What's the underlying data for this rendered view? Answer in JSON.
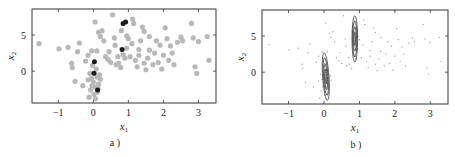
{
  "chart_data": [
    {
      "type": "scatter",
      "panel": "a",
      "caption": "a )",
      "xlabel": "x1",
      "ylabel": "x2",
      "xlim": [
        -1.75,
        3.5
      ],
      "ylim": [
        -4.4,
        8.6
      ],
      "xticks": [
        -1,
        0,
        1,
        2,
        3
      ],
      "yticks": [
        0,
        5
      ],
      "grid": false,
      "series": [
        {
          "name": "data points",
          "color": "#b8b8b8",
          "points": [
            [
              -1.55,
              3.8
            ],
            [
              -0.98,
              3.1
            ],
            [
              -0.72,
              3.3
            ],
            [
              -0.62,
              1.1
            ],
            [
              -0.6,
              0.5
            ],
            [
              -0.45,
              2.7
            ],
            [
              -0.4,
              3.9
            ],
            [
              -0.52,
              -1.4
            ],
            [
              -0.3,
              -2.0
            ],
            [
              -0.22,
              1.4
            ],
            [
              -0.15,
              2.2
            ],
            [
              -0.05,
              2.8
            ],
            [
              0.05,
              6.8
            ],
            [
              0.15,
              5.4
            ],
            [
              0.2,
              4.8
            ],
            [
              0.25,
              5.6
            ],
            [
              0.3,
              4.2
            ],
            [
              0.1,
              2.8
            ],
            [
              0.35,
              2.0
            ],
            [
              0.42,
              1.6
            ],
            [
              0.5,
              1.2
            ],
            [
              0.55,
              7.8
            ],
            [
              0.6,
              4.6
            ],
            [
              0.62,
              3.6
            ],
            [
              0.7,
              2.0
            ],
            [
              0.72,
              1.1
            ],
            [
              0.78,
              0.5
            ],
            [
              0.85,
              2.3
            ],
            [
              0.9,
              1.8
            ],
            [
              0.95,
              3.2
            ],
            [
              1.0,
              4.5
            ],
            [
              1.05,
              2.0
            ],
            [
              1.1,
              3.8
            ],
            [
              1.12,
              7.2
            ],
            [
              1.15,
              6.6
            ],
            [
              1.2,
              1.5
            ],
            [
              1.25,
              0.6
            ],
            [
              1.3,
              3.0
            ],
            [
              1.35,
              4.2
            ],
            [
              1.4,
              6.1
            ],
            [
              1.45,
              5.5
            ],
            [
              1.5,
              0.2
            ],
            [
              1.55,
              1.8
            ],
            [
              1.6,
              4.8
            ],
            [
              1.7,
              0.9
            ],
            [
              1.75,
              2.5
            ],
            [
              1.8,
              4.2
            ],
            [
              1.85,
              1.2
            ],
            [
              1.9,
              3.6
            ],
            [
              1.95,
              0.3
            ],
            [
              2.0,
              2.2
            ],
            [
              2.05,
              6.0
            ],
            [
              2.1,
              4.5
            ],
            [
              2.2,
              3.5
            ],
            [
              2.25,
              2.5
            ],
            [
              2.3,
              0.9
            ],
            [
              2.4,
              4.0
            ],
            [
              2.5,
              4.7
            ],
            [
              2.55,
              4.2
            ],
            [
              2.8,
              6.6
            ],
            [
              2.85,
              4.6
            ],
            [
              2.9,
              0.6
            ],
            [
              2.95,
              -0.3
            ],
            [
              3.0,
              4.1
            ],
            [
              3.25,
              4.8
            ],
            [
              3.3,
              1.5
            ],
            [
              1.3,
              2.2
            ],
            [
              1.45,
              1.1
            ],
            [
              0.95,
              4.9
            ],
            [
              0.8,
              5.6
            ],
            [
              1.6,
              2.9
            ],
            [
              2.15,
              1.5
            ],
            [
              0.65,
              0.9
            ],
            [
              0.45,
              2.7
            ],
            [
              -0.1,
              -0.3
            ],
            [
              -0.05,
              -1.0
            ],
            [
              0.0,
              -1.5
            ],
            [
              0.05,
              -2.2
            ],
            [
              0.1,
              -0.8
            ],
            [
              0.15,
              -1.8
            ],
            [
              -0.08,
              -2.6
            ],
            [
              0.02,
              -3.2
            ],
            [
              0.12,
              -2.9
            ],
            [
              -0.12,
              -3.6
            ],
            [
              0.08,
              0.3
            ],
            [
              -0.02,
              0.8
            ],
            [
              0.18,
              -0.5
            ],
            [
              -0.15,
              -1.2
            ],
            [
              0.2,
              -1.1
            ],
            [
              0.06,
              -3.8
            ],
            [
              -0.04,
              -2.0
            ],
            [
              0.14,
              -2.4
            ]
          ]
        },
        {
          "name": "highlighted points",
          "color": "#1a1a1a",
          "points": [
            [
              0.85,
              6.6
            ],
            [
              0.92,
              6.8
            ],
            [
              0.82,
              3.0
            ],
            [
              0.03,
              1.3
            ],
            [
              0.02,
              -0.3
            ],
            [
              0.12,
              -2.6
            ]
          ]
        }
      ]
    },
    {
      "type": "scatter",
      "panel": "b",
      "caption": "b )",
      "xlabel": "x1",
      "ylabel": "x2",
      "xlim": [
        -1.75,
        3.5
      ],
      "ylim": [
        -4.4,
        8.6
      ],
      "xticks": [
        -1,
        0,
        1,
        2,
        3
      ],
      "yticks": [
        0,
        5
      ],
      "grid": false,
      "series": [
        {
          "name": "data points (small markers)",
          "color": "#a0a0a0",
          "marker": "small"
        },
        {
          "name": "density contours",
          "color": "#222222",
          "contours": [
            {
              "center": [
                0.87,
                4.6
              ],
              "rx": [
                0.08,
                0.06,
                0.04,
                0.02
              ],
              "ry": [
                3.2,
                2.5,
                1.7,
                0.9
              ]
            },
            {
              "center": [
                0.05,
                -0.6
              ],
              "rx": [
                0.09,
                0.065,
                0.04,
                0.02
              ],
              "ry": [
                3.3,
                2.6,
                1.8,
                1.0
              ],
              "tilt_deg": -4
            }
          ]
        }
      ]
    }
  ],
  "panels": [
    {
      "caption": "a )",
      "xlabel_main": "x",
      "xlabel_sub": "1",
      "ylabel_main": "x",
      "ylabel_sub": "2"
    },
    {
      "caption": "b )",
      "xlabel_main": "x",
      "xlabel_sub": "1",
      "ylabel_main": "x",
      "ylabel_sub": "2"
    }
  ]
}
